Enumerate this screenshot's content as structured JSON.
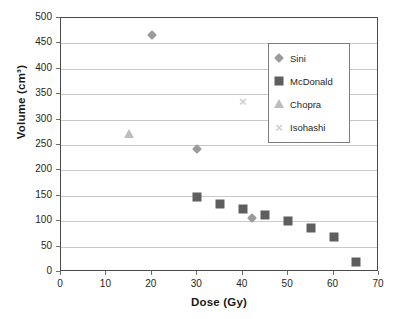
{
  "chart_data": {
    "type": "scatter",
    "title": "",
    "xlabel": "Dose (Gy)",
    "ylabel": "Volume (cm³)",
    "xlim": [
      0,
      70
    ],
    "ylim": [
      0,
      500
    ],
    "xticks": [
      0,
      10,
      20,
      30,
      40,
      50,
      60,
      70
    ],
    "yticks": [
      0,
      50,
      100,
      150,
      200,
      250,
      300,
      350,
      400,
      450,
      500
    ],
    "grid": "horizontal",
    "legend_position": "upper right",
    "series": [
      {
        "name": "Sini",
        "marker": "diamond",
        "color": "#9b9b9b",
        "points": [
          {
            "x": 20,
            "y": 467
          },
          {
            "x": 30,
            "y": 242
          },
          {
            "x": 42,
            "y": 106
          }
        ]
      },
      {
        "name": "McDonald",
        "marker": "square",
        "color": "#5e5e5e",
        "points": [
          {
            "x": 30,
            "y": 147
          },
          {
            "x": 35,
            "y": 134
          },
          {
            "x": 40,
            "y": 124
          },
          {
            "x": 45,
            "y": 112
          },
          {
            "x": 50,
            "y": 101
          },
          {
            "x": 55,
            "y": 87
          },
          {
            "x": 60,
            "y": 69
          },
          {
            "x": 65,
            "y": 20
          }
        ]
      },
      {
        "name": "Chopra",
        "marker": "triangle",
        "color": "#bdbdbd",
        "points": [
          {
            "x": 15,
            "y": 271
          }
        ]
      },
      {
        "name": "Isohashi",
        "marker": "cross",
        "color": "#cfcfcf",
        "points": [
          {
            "x": 40,
            "y": 337
          }
        ]
      }
    ]
  },
  "axes": {
    "x_title": "Dose (Gy)",
    "y_title": "Volume (cm³)"
  },
  "legend": {
    "entries": [
      {
        "label": "Sini",
        "marker": "diamond-icon"
      },
      {
        "label": "McDonald",
        "marker": "square-icon"
      },
      {
        "label": "Chopra",
        "marker": "triangle-icon"
      },
      {
        "label": "Isohashi",
        "marker": "cross-icon"
      }
    ]
  }
}
